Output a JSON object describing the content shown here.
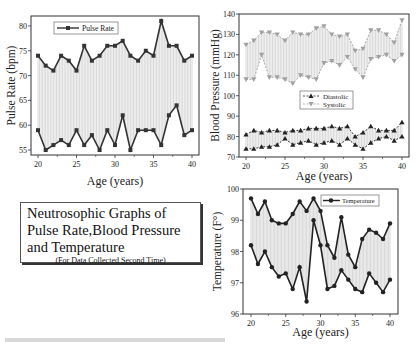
{
  "title_box": {
    "main": "Neutrosophic Graphs of Pulse Rate,Blood Pressure and Temperature",
    "subtitle": "(For Data Collected Second Time)"
  },
  "colors": {
    "pulse": "#333333",
    "diastolic": "#222222",
    "systolic": "#a0a0a0",
    "temperature": "#222222",
    "fill_lines": "#bbbbbb"
  },
  "chart_data": [
    {
      "type": "line",
      "title": "Pulse Rate",
      "xlabel": "Age (years)",
      "ylabel": "Pulse Rate (bpm)",
      "x": [
        20,
        21,
        22,
        23,
        24,
        25,
        26,
        27,
        28,
        29,
        30,
        31,
        32,
        33,
        34,
        35,
        36,
        37,
        38,
        39,
        40
      ],
      "xticks": [
        20,
        25,
        30,
        35,
        40
      ],
      "yticks": [
        55,
        60,
        65,
        70,
        75,
        80
      ],
      "ylim": [
        54,
        82
      ],
      "legend": [
        "Pulse Rate"
      ],
      "legend_position": "upper left",
      "series": [
        {
          "name": "Pulse Rate (upper)",
          "values": [
            74,
            72,
            71,
            74,
            73,
            71,
            76,
            73,
            74,
            76,
            76,
            77,
            74,
            73,
            75,
            74,
            81,
            76,
            76,
            73,
            74
          ]
        },
        {
          "name": "Pulse Rate (lower)",
          "values": [
            59,
            55,
            56,
            57,
            56,
            59,
            56,
            58,
            55,
            59,
            56,
            62,
            55,
            59,
            59,
            59,
            56,
            62,
            64,
            58,
            59
          ]
        }
      ]
    },
    {
      "type": "line",
      "title": "Blood Pressure",
      "xlabel": "Age (years)",
      "ylabel": "Blood Pressure (mmHg)",
      "x": [
        20,
        21,
        22,
        23,
        24,
        25,
        26,
        27,
        28,
        29,
        30,
        31,
        32,
        33,
        34,
        35,
        36,
        37,
        38,
        39,
        40
      ],
      "xticks": [
        20,
        25,
        30,
        35,
        40
      ],
      "yticks": [
        70,
        80,
        90,
        100,
        110,
        120,
        130,
        140
      ],
      "ylim": [
        70,
        140
      ],
      "legend": [
        "Diastolic",
        "Systolic"
      ],
      "legend_position": "center right",
      "series": [
        {
          "name": "Systolic (upper)",
          "values": [
            125,
            127,
            131,
            131,
            130,
            127,
            131,
            130,
            130,
            133,
            134,
            130,
            129,
            130,
            122,
            123,
            132,
            132,
            130,
            126,
            137
          ]
        },
        {
          "name": "Systolic (lower)",
          "values": [
            108,
            108,
            120,
            109,
            109,
            108,
            106,
            110,
            109,
            108,
            116,
            117,
            115,
            119,
            113,
            109,
            118,
            119,
            120,
            117,
            120
          ]
        },
        {
          "name": "Diastolic (upper)",
          "values": [
            81,
            83,
            82,
            83,
            83,
            82,
            83,
            83,
            84,
            84,
            84,
            85,
            84,
            85,
            80,
            82,
            85,
            83,
            83,
            83,
            87
          ]
        },
        {
          "name": "Diastolic (lower)",
          "values": [
            74,
            74,
            75,
            75,
            76,
            79,
            76,
            77,
            78,
            76,
            77,
            78,
            76,
            79,
            76,
            74,
            77,
            79,
            80,
            78,
            80
          ]
        }
      ]
    },
    {
      "type": "line",
      "title": "Temperature",
      "xlabel": "Age (years)",
      "ylabel": "Temperature (F°)",
      "x": [
        20,
        21,
        22,
        23,
        24,
        25,
        26,
        27,
        28,
        29,
        30,
        31,
        32,
        33,
        34,
        35,
        36,
        37,
        38,
        39,
        40
      ],
      "xticks": [
        20,
        25,
        30,
        35,
        40
      ],
      "yticks": [
        96,
        97,
        98,
        99,
        100
      ],
      "ylim": [
        96,
        100
      ],
      "legend": [
        "Temperature"
      ],
      "legend_position": "upper right",
      "series": [
        {
          "name": "Temperature (upper)",
          "values": [
            99.7,
            99.2,
            99.6,
            99.0,
            98.9,
            98.9,
            99.2,
            99.6,
            99.3,
            99.7,
            99.3,
            98.2,
            97.8,
            99.1,
            97.9,
            97.5,
            98.4,
            98.7,
            98.6,
            98.4,
            98.9
          ]
        },
        {
          "name": "Temperature (lower)",
          "values": [
            98.2,
            97.6,
            98.0,
            97.5,
            97.2,
            97.3,
            96.8,
            97.5,
            96.4,
            99.0,
            98.2,
            96.8,
            96.9,
            97.4,
            97.1,
            96.8,
            96.7,
            97.3,
            97.0,
            96.7,
            97.1
          ]
        }
      ]
    }
  ]
}
